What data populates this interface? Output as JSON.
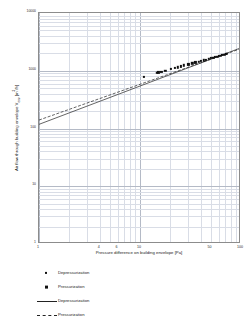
{
  "chart_data": {
    "type": "scatter",
    "title": "",
    "xlabel": "Pressure difference on building envelope [Pa]",
    "ylabel": "Air flow through building envelope V_env [m³/h]",
    "ylabel_parts": {
      "main": "Air flow through building envelope V",
      "subscript": "env",
      "unit_prefix": " [m",
      "unit_sup": "3",
      "unit_suffix": "/h]"
    },
    "xscale": "log",
    "yscale": "log",
    "xlim": [
      1,
      100
    ],
    "ylim": [
      1,
      10000
    ],
    "grid": true,
    "grid_minor": true,
    "legend_position": "below-left",
    "xticks": [
      {
        "value": 1,
        "label": "1"
      },
      {
        "value": 4,
        "label": "4"
      },
      {
        "value": 6,
        "label": "6"
      },
      {
        "value": 10,
        "label": "10"
      },
      {
        "value": 50,
        "label": "50"
      },
      {
        "value": 100,
        "label": "100"
      }
    ],
    "yticks": [
      {
        "value": 1,
        "label": "1"
      },
      {
        "value": 10,
        "label": "10"
      },
      {
        "value": 100,
        "label": "100"
      },
      {
        "value": 1000,
        "label": "1000"
      },
      {
        "value": 10000,
        "label": "10000"
      }
    ],
    "series": [
      {
        "name": "Depressurization",
        "kind": "scatter",
        "marker": "small-square",
        "color": "#111111",
        "points": [
          [
            10.9,
            793
          ],
          [
            15.2,
            933
          ],
          [
            16.3,
            962
          ],
          [
            20.4,
            1065
          ],
          [
            22.2,
            1110
          ],
          [
            25.6,
            1190
          ],
          [
            30.1,
            1290
          ],
          [
            35.4,
            1395
          ],
          [
            40.2,
            1480
          ],
          [
            45.3,
            1565
          ],
          [
            50.1,
            1645
          ],
          [
            55.4,
            1725
          ],
          [
            60.6,
            1800
          ],
          [
            65.2,
            1865
          ],
          [
            70.4,
            1935
          ]
        ]
      },
      {
        "name": "Pressurization",
        "kind": "scatter",
        "marker": "square",
        "color": "#111111",
        "points": [
          [
            14.6,
            930
          ],
          [
            17.8,
            1010
          ],
          [
            23.8,
            1150
          ],
          [
            27.3,
            1235
          ],
          [
            33.0,
            1350
          ],
          [
            38.1,
            1445
          ],
          [
            43.0,
            1525
          ],
          [
            48.0,
            1610
          ],
          [
            53.2,
            1690
          ],
          [
            58.1,
            1765
          ],
          [
            63.0,
            1835
          ],
          [
            68.2,
            1900
          ],
          [
            72.8,
            1960
          ]
        ]
      },
      {
        "name": "Depressurization",
        "kind": "line",
        "style": "solid",
        "color": "#222222",
        "fit": {
          "at_x_1": 118,
          "at_x_100": 2500,
          "exponent": 0.665
        }
      },
      {
        "name": "Pressurization",
        "kind": "line",
        "style": "dashed",
        "color": "#222222",
        "fit": {
          "at_x_1": 140,
          "at_x_100": 2420,
          "exponent": 0.619
        }
      }
    ],
    "legend": [
      {
        "label": "Depressurization",
        "key": "marker-small"
      },
      {
        "label": "Pressurization",
        "key": "marker-big"
      },
      {
        "label": "Depressurization",
        "key": "line-solid"
      },
      {
        "label": "Pressurization",
        "key": "line-dashed"
      }
    ],
    "colors": {
      "grid_minor": "#d9dde6",
      "grid_major": "#b4bac6",
      "frame": "#8c8c8c",
      "data": "#111111",
      "text": "#1a1a1a",
      "background": "#ffffff"
    }
  }
}
